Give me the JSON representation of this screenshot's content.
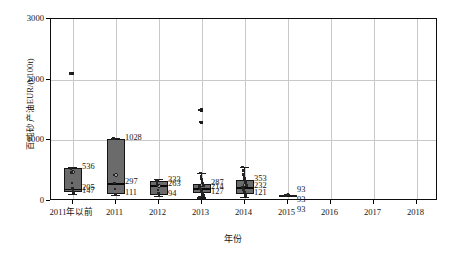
{
  "chart_data": {
    "type": "box",
    "title": "",
    "xlabel": "年份",
    "ylabel": "百吨砂产油EUR/(t/100t)",
    "ylim": [
      0,
      3000
    ],
    "yticks": [
      0,
      1000,
      2000,
      3000
    ],
    "ytick_labels": [
      "0",
      "1000",
      "2000",
      "3000"
    ],
    "grid": "vertical-and-horizontal",
    "legend": "none",
    "categories": [
      "2011年以前",
      "2011",
      "2012",
      "2013",
      "2014",
      "2015",
      "2016",
      "2017",
      "2018"
    ],
    "boxes": [
      {
        "category": "2011年以前",
        "q3": 536,
        "median": 205,
        "q1": 147,
        "whisker_high": 560,
        "whisker_low": 120,
        "mean": 470,
        "labels": [
          "536",
          "205",
          "147"
        ],
        "outliers": [
          2100
        ],
        "points": [
          2100,
          536,
          470,
          300,
          205,
          180,
          147,
          140
        ]
      },
      {
        "category": "2011",
        "q3": 1028,
        "median": 297,
        "q1": 111,
        "whisker_high": 1040,
        "whisker_low": 95,
        "mean": 430,
        "labels": [
          "1028",
          "297",
          "111"
        ],
        "outliers": [],
        "points": [
          1028,
          430,
          297,
          200,
          111
        ]
      },
      {
        "category": "2012",
        "q3": 333,
        "median": 263,
        "q1": 94,
        "whisker_high": 360,
        "whisker_low": 80,
        "mean": 250,
        "labels": [
          "333",
          "263",
          "94"
        ],
        "outliers": [],
        "points": [
          333,
          300,
          263,
          180,
          120,
          94
        ]
      },
      {
        "category": "2013",
        "q3": 287,
        "median": 214,
        "q1": 127,
        "whisker_high": 460,
        "whisker_low": 60,
        "mean": 260,
        "labels": [
          "287",
          "214",
          "127"
        ],
        "outliers": [
          1500,
          1300
        ],
        "points": [
          1500,
          1300,
          460,
          400,
          360,
          330,
          300,
          287,
          260,
          240,
          214,
          200,
          180,
          160,
          140,
          127,
          110,
          90,
          60
        ]
      },
      {
        "category": "2014",
        "q3": 353,
        "median": 232,
        "q1": 121,
        "whisker_high": 560,
        "whisker_low": 70,
        "mean": 270,
        "labels": [
          "353",
          "232",
          "121"
        ],
        "outliers": [],
        "points": [
          560,
          500,
          440,
          400,
          370,
          353,
          320,
          290,
          260,
          232,
          210,
          190,
          170,
          150,
          121,
          100,
          70
        ]
      },
      {
        "category": "2015",
        "q3": 93,
        "median": 93,
        "q1": 93,
        "whisker_high": 93,
        "whisker_low": 93,
        "mean": 93,
        "labels": [
          "93",
          "93",
          "93"
        ],
        "outliers": [],
        "points": [
          93
        ]
      },
      {
        "category": "2016",
        "q3": null,
        "median": null,
        "q1": null,
        "labels": [],
        "outliers": [],
        "points": []
      },
      {
        "category": "2017",
        "q3": null,
        "median": null,
        "q1": null,
        "labels": [],
        "outliers": [],
        "points": []
      },
      {
        "category": "2018",
        "q3": null,
        "median": null,
        "q1": null,
        "labels": [],
        "outliers": [],
        "points": []
      }
    ],
    "colors": {
      "box_fill": "#6b6b6b",
      "box_edge": "#141414",
      "median": "#0a0a0a",
      "grid": "#c9c9c9",
      "frame": "#0d0d0d",
      "point": "#232323",
      "background": "#ffffff"
    }
  }
}
